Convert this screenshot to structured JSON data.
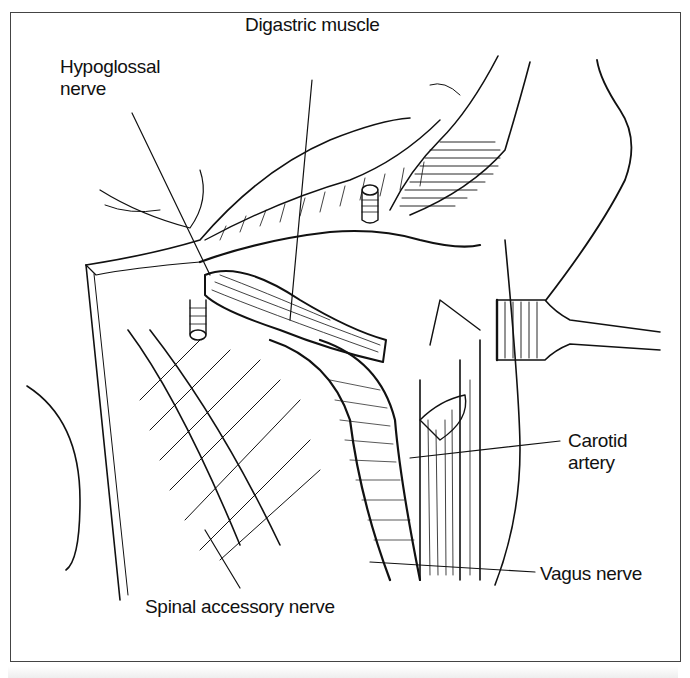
{
  "figure": {
    "type": "surgical anatomy line drawing",
    "labels": {
      "digastric": "Digastric muscle",
      "hypoglossal_line1": "Hypoglossal",
      "hypoglossal_line2": "nerve",
      "carotid_line1": "Carotid",
      "carotid_line2": "artery",
      "vagus": "Vagus nerve",
      "spinal_accessory": "Spinal accessory nerve"
    },
    "colors": {
      "ink": "#111111",
      "frame": "#444444",
      "background": "#ffffff"
    }
  }
}
